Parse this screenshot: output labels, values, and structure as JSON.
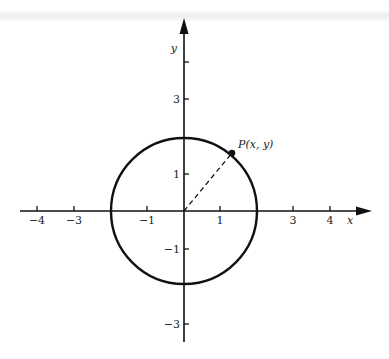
{
  "diagram": {
    "axes": {
      "x_label": "x",
      "y_label": "y",
      "x_ticks": [
        {
          "value": -4,
          "label": "−4"
        },
        {
          "value": -3,
          "label": "−3"
        },
        {
          "value": -1,
          "label": "−1"
        },
        {
          "value": 1,
          "label": "1"
        },
        {
          "value": 3,
          "label": "3"
        },
        {
          "value": 4,
          "label": "4"
        }
      ],
      "y_ticks": [
        {
          "value": 3,
          "label": "3"
        },
        {
          "value": 1,
          "label": "1"
        },
        {
          "value": -1,
          "label": "−1"
        },
        {
          "value": -3,
          "label": "−3"
        }
      ]
    },
    "circle": {
      "center": [
        0,
        0
      ],
      "radius": 2
    },
    "point": {
      "label": "P(x, y)",
      "label_prefix": "P",
      "label_args": "(x, y)"
    },
    "radius_segment": {
      "style": "dashed",
      "from": "origin",
      "to": "P"
    },
    "colors": {
      "ink": "#111111",
      "background": "#ffffff"
    }
  }
}
